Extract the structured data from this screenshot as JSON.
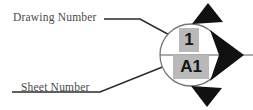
{
  "diagram": {
    "title_labels": {
      "drawing_number_label": "Drawing Number",
      "sheet_number_label": "Sheet Number"
    },
    "marker": {
      "drawing_number": "1",
      "sheet_number": "A1"
    },
    "colors": {
      "background": "#ffffff",
      "label_text": "#4a4a4a",
      "value_text": "#151515",
      "value_highlight": "#b9b9b9",
      "line": "#2b2b2b",
      "arrowhead_fill": "#111111",
      "circle_stroke": "#555555"
    },
    "icons": {
      "top_arrowhead": "triangle-up-left-icon",
      "right_arrowhead": "triangle-right-icon",
      "bottom_arrowhead": "triangle-down-left-icon",
      "drawing_leader": "leader-line-arrow-icon",
      "sheet_leader": "leader-line-arrow-icon",
      "reference_circle": "circle-divider-icon"
    }
  }
}
